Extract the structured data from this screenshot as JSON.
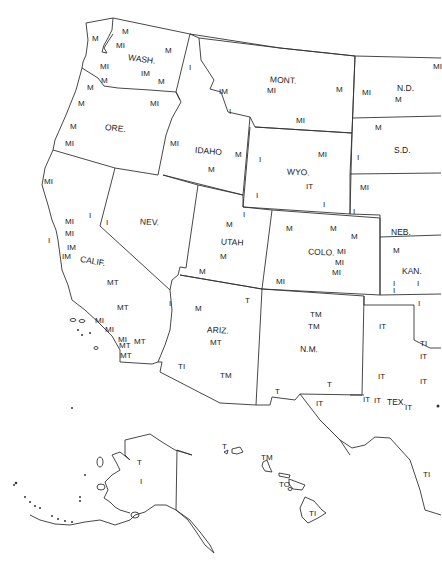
{
  "map": {
    "type": "outline map of western United States with state abbreviations and code letters",
    "stroke_color": "#333333",
    "background": "#ffffff"
  },
  "states": [
    {
      "name": "WASH.",
      "x": 128,
      "y": 55,
      "r": 8
    },
    {
      "name": "ORE.",
      "x": 105,
      "y": 124,
      "r": 6
    },
    {
      "name": "IDAHO",
      "x": 195,
      "y": 147,
      "r": 5
    },
    {
      "name": "MONT.",
      "x": 270,
      "y": 76,
      "r": 3
    },
    {
      "name": "N.D.",
      "x": 397,
      "y": 84,
      "r": 0
    },
    {
      "name": "S.D.",
      "x": 394,
      "y": 146,
      "r": 0
    },
    {
      "name": "WYO.",
      "x": 287,
      "y": 168,
      "r": 3
    },
    {
      "name": "NEB.",
      "x": 391,
      "y": 228,
      "r": 0
    },
    {
      "name": "NEV.",
      "x": 140,
      "y": 218,
      "r": 3
    },
    {
      "name": "UTAH",
      "x": 221,
      "y": 238,
      "r": 3
    },
    {
      "name": "COLO.",
      "x": 308,
      "y": 248,
      "r": 2
    },
    {
      "name": "KAN.",
      "x": 402,
      "y": 267,
      "r": 0
    },
    {
      "name": "CALIF.",
      "x": 80,
      "y": 257,
      "r": 10
    },
    {
      "name": "ARIZ.",
      "x": 207,
      "y": 326,
      "r": 3
    },
    {
      "name": "N.M.",
      "x": 300,
      "y": 345,
      "r": 2
    },
    {
      "name": "TEX.",
      "x": 387,
      "y": 398,
      "r": 0
    }
  ],
  "codes": [
    {
      "t": "M",
      "x": 122,
      "y": 28
    },
    {
      "t": "M",
      "x": 92,
      "y": 35
    },
    {
      "t": "MI",
      "x": 116,
      "y": 42
    },
    {
      "t": "M",
      "x": 165,
      "y": 47
    },
    {
      "t": "I",
      "x": 189,
      "y": 64
    },
    {
      "t": "MI",
      "x": 100,
      "y": 63
    },
    {
      "t": "IM",
      "x": 141,
      "y": 70
    },
    {
      "t": "M",
      "x": 158,
      "y": 78
    },
    {
      "t": "M",
      "x": 101,
      "y": 77
    },
    {
      "t": "M",
      "x": 87,
      "y": 84
    },
    {
      "t": "M",
      "x": 78,
      "y": 100
    },
    {
      "t": "MI",
      "x": 150,
      "y": 100
    },
    {
      "t": "M",
      "x": 70,
      "y": 123
    },
    {
      "t": "MI",
      "x": 65,
      "y": 140
    },
    {
      "t": "MI",
      "x": 170,
      "y": 140
    },
    {
      "t": "M",
      "x": 208,
      "y": 166
    },
    {
      "t": "IM",
      "x": 219,
      "y": 88
    },
    {
      "t": "MI",
      "x": 267,
      "y": 87
    },
    {
      "t": "M",
      "x": 336,
      "y": 86
    },
    {
      "t": "I",
      "x": 229,
      "y": 108
    },
    {
      "t": "MI",
      "x": 296,
      "y": 117
    },
    {
      "t": "MI",
      "x": 362,
      "y": 89
    },
    {
      "t": "M",
      "x": 395,
      "y": 96
    },
    {
      "t": "M",
      "x": 375,
      "y": 124
    },
    {
      "t": "MI",
      "x": 433,
      "y": 63
    },
    {
      "t": "M",
      "x": 235,
      "y": 151
    },
    {
      "t": "I",
      "x": 259,
      "y": 156
    },
    {
      "t": "MI",
      "x": 318,
      "y": 151
    },
    {
      "t": "I",
      "x": 357,
      "y": 154
    },
    {
      "t": "IT",
      "x": 306,
      "y": 183
    },
    {
      "t": "I",
      "x": 256,
      "y": 192
    },
    {
      "t": "I",
      "x": 323,
      "y": 201
    },
    {
      "t": "MI",
      "x": 360,
      "y": 184
    },
    {
      "t": "I",
      "x": 353,
      "y": 208
    },
    {
      "t": "MI",
      "x": 44,
      "y": 178
    },
    {
      "t": "I",
      "x": 89,
      "y": 212
    },
    {
      "t": "MI",
      "x": 65,
      "y": 218
    },
    {
      "t": "I",
      "x": 106,
      "y": 219
    },
    {
      "t": "MI",
      "x": 65,
      "y": 230
    },
    {
      "t": "I",
      "x": 48,
      "y": 237
    },
    {
      "t": "IM",
      "x": 67,
      "y": 244
    },
    {
      "t": "IM",
      "x": 62,
      "y": 253
    },
    {
      "t": "MT",
      "x": 107,
      "y": 279
    },
    {
      "t": "MT",
      "x": 117,
      "y": 304
    },
    {
      "t": "I",
      "x": 169,
      "y": 300
    },
    {
      "t": "MI",
      "x": 95,
      "y": 317
    },
    {
      "t": "MI",
      "x": 105,
      "y": 326
    },
    {
      "t": "MI",
      "x": 118,
      "y": 336
    },
    {
      "t": "MT",
      "x": 134,
      "y": 338
    },
    {
      "t": "MT",
      "x": 119,
      "y": 342
    },
    {
      "t": "MT",
      "x": 120,
      "y": 352
    },
    {
      "t": "I",
      "x": 243,
      "y": 211
    },
    {
      "t": "M",
      "x": 226,
      "y": 221
    },
    {
      "t": "M",
      "x": 220,
      "y": 253
    },
    {
      "t": "M",
      "x": 199,
      "y": 268
    },
    {
      "t": "M",
      "x": 286,
      "y": 225
    },
    {
      "t": "M",
      "x": 330,
      "y": 225
    },
    {
      "t": "M",
      "x": 351,
      "y": 233
    },
    {
      "t": "MI",
      "x": 337,
      "y": 248
    },
    {
      "t": "MI",
      "x": 335,
      "y": 259
    },
    {
      "t": "MI",
      "x": 332,
      "y": 269
    },
    {
      "t": "MI",
      "x": 276,
      "y": 278
    },
    {
      "t": "M",
      "x": 393,
      "y": 247
    },
    {
      "t": "I",
      "x": 417,
      "y": 280
    },
    {
      "t": "I",
      "x": 393,
      "y": 287
    },
    {
      "t": "T",
      "x": 245,
      "y": 297
    },
    {
      "t": "M",
      "x": 195,
      "y": 305
    },
    {
      "t": "MT",
      "x": 210,
      "y": 339
    },
    {
      "t": "TI",
      "x": 178,
      "y": 363
    },
    {
      "t": "TM",
      "x": 220,
      "y": 372
    },
    {
      "t": "TM",
      "x": 310,
      "y": 311
    },
    {
      "t": "TM",
      "x": 308,
      "y": 323
    },
    {
      "t": "T",
      "x": 275,
      "y": 388
    },
    {
      "t": "T",
      "x": 327,
      "y": 381
    },
    {
      "t": "IT",
      "x": 316,
      "y": 400
    },
    {
      "t": "I",
      "x": 393,
      "y": 280
    },
    {
      "t": "I",
      "x": 418,
      "y": 300
    },
    {
      "t": "IT",
      "x": 379,
      "y": 323
    },
    {
      "t": "TI",
      "x": 420,
      "y": 340
    },
    {
      "t": "IT",
      "x": 420,
      "y": 353
    },
    {
      "t": "IT",
      "x": 378,
      "y": 373
    },
    {
      "t": "IT",
      "x": 420,
      "y": 378
    },
    {
      "t": "IT",
      "x": 363,
      "y": 396
    },
    {
      "t": "IT",
      "x": 374,
      "y": 397
    },
    {
      "t": "IT",
      "x": 405,
      "y": 404
    },
    {
      "t": "T",
      "x": 137,
      "y": 459
    },
    {
      "t": "I",
      "x": 140,
      "y": 478
    },
    {
      "t": "T",
      "x": 222,
      "y": 443
    },
    {
      "t": "TM",
      "x": 261,
      "y": 454
    },
    {
      "t": "TO",
      "x": 279,
      "y": 481
    },
    {
      "t": "TI",
      "x": 309,
      "y": 510
    },
    {
      "t": "TI",
      "x": 423,
      "y": 471
    }
  ]
}
